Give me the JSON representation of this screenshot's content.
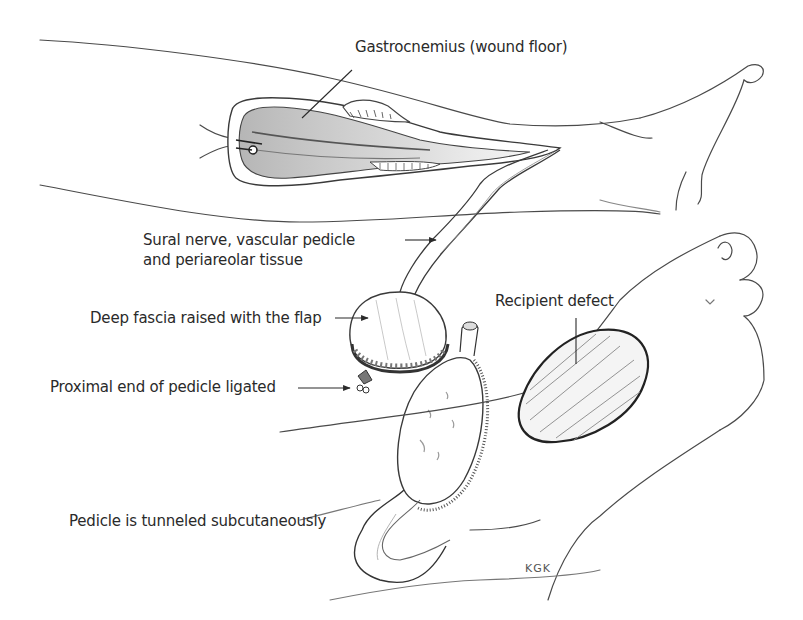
{
  "figure": {
    "colors": {
      "line": "#3a3a3a",
      "shade": "#8a8a8a",
      "text": "#2a2a2a",
      "background": "#ffffff"
    }
  },
  "labels": {
    "gastrocnemius": "Gastrocnemius (wound floor)",
    "sural_nerve_line1": "Sural nerve, vascular pedicle",
    "sural_nerve_line2": "and periareolar tissue",
    "deep_fascia": "Deep fascia raised with the flap",
    "proximal_end": "Proximal end of pedicle ligated",
    "recipient_defect": "Recipient defect",
    "tunneled": "Pedicle is tunneled subcutaneously"
  },
  "signature": "KGK"
}
